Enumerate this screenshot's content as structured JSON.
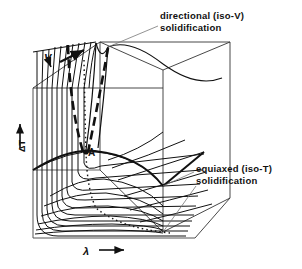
{
  "figure": {
    "type": "3d-schematic-surface-diagram",
    "background": "#ffffff",
    "ink": "#111111",
    "axes": {
      "y": {
        "label": "ΔT",
        "arrow": "up",
        "name": "undercooling"
      },
      "x": {
        "label": "λ",
        "arrow": "right",
        "name": "spacing"
      },
      "z": {
        "label": "V",
        "arrow": "up-right",
        "name": "growth-velocity"
      }
    },
    "annotations": [
      {
        "id": "directional",
        "line1": "directional (iso-V)",
        "line2": "solidification"
      },
      {
        "id": "equiaxed",
        "line1": "equiaxed (iso-T)",
        "line2": "solidification"
      }
    ],
    "points": [
      {
        "id": "A",
        "label": "A"
      }
    ],
    "curve_families": {
      "iso_v": {
        "count": 10,
        "style": "solid-thin",
        "shape": "nested-U"
      },
      "iso_t": {
        "count": 8,
        "style": "solid-thin",
        "shape": "fanning"
      },
      "valley_dashed": {
        "count": 2,
        "style": "thick-dashed"
      },
      "valley_floor": {
        "count": 1,
        "style": "dotted"
      }
    }
  }
}
